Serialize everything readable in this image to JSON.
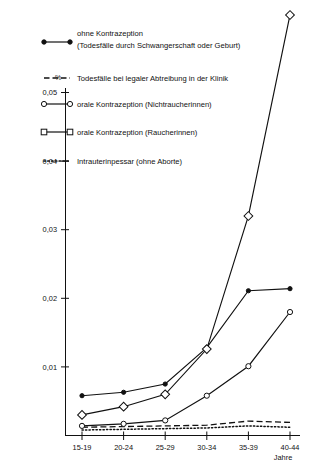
{
  "chart_data": {
    "type": "line",
    "title": "",
    "xlabel": "Jahre",
    "ylabel": "%",
    "categories": [
      "15-19",
      "20-24",
      "25-29",
      "30-34",
      "35-39",
      "40-44"
    ],
    "ylim": [
      0,
      0.0615
    ],
    "yticks": [
      0.01,
      0.02,
      0.03,
      0.04,
      0.05
    ],
    "ytick_labels": [
      "0,01",
      "0,02",
      "0,03",
      "0,04",
      "0,05"
    ],
    "grid": false,
    "legend_position": "top-left",
    "series": [
      {
        "name": "ohne Kontrazeption (Todesfälle durch Schwangerschaft oder Geburt)",
        "marker": "filled-circle",
        "line": "solid",
        "values": [
          0.0058,
          0.0063,
          0.0075,
          0.0128,
          0.0211,
          0.0214
        ]
      },
      {
        "name": "Todesfälle bei legaler Abtreibung in der Klinik",
        "marker": "none",
        "line": "dashed",
        "values": [
          0.0012,
          0.0013,
          0.0014,
          0.0015,
          0.0021,
          0.0019
        ]
      },
      {
        "name": "orale Kontrazeption (Nichtraucherinnen)",
        "marker": "open-circle",
        "line": "solid",
        "values": [
          0.0014,
          0.0017,
          0.0022,
          0.0058,
          0.0101,
          0.018
        ]
      },
      {
        "name": "orale Kontrazeption (Raucherinnen)",
        "marker": "open-square",
        "line": "solid",
        "values": [
          0.003,
          0.0042,
          0.006,
          0.0126,
          0.032,
          0.0613
        ]
      },
      {
        "name": "Intrauterinpessar (ohne Aborte)",
        "marker": "none",
        "line": "dotted",
        "values": [
          0.0008,
          0.0009,
          0.001,
          0.0011,
          0.0014,
          0.0012
        ]
      }
    ]
  },
  "axis": {
    "y_unit": "%",
    "x_axis_name": "Jahre",
    "y_tick_labels": [
      "0,05",
      "0,04",
      "0,03",
      "0,02",
      "0,01"
    ],
    "x_tick_labels": [
      "15-19",
      "20-24",
      "25-29",
      "30-34",
      "35-39",
      "40-44"
    ]
  },
  "legend": {
    "items": [
      {
        "key": "ohne-kontrazeption",
        "line1": "ohne Kontrazeption",
        "line2": "(Todesfälle durch Schwangerschaft oder Geburt)",
        "sample": "solid-filled-circle"
      },
      {
        "key": "legale-abtreibung",
        "line1": "Todesfälle bei legaler Abtreibung in der Klinik",
        "line2": "",
        "sample": "dashed"
      },
      {
        "key": "orale-nichtraucherinnen",
        "line1": "orale Kontrazeption (Nichtraucherinnen)",
        "line2": "",
        "sample": "solid-open-circle"
      },
      {
        "key": "orale-raucherinnen",
        "line1": "orale Kontrazeption (Raucherinnen)",
        "line2": "",
        "sample": "solid-open-square"
      },
      {
        "key": "intrauterinpessar",
        "line1": "Intrauterinpessar (ohne Aborte)",
        "line2": "",
        "sample": "dotted"
      }
    ]
  }
}
